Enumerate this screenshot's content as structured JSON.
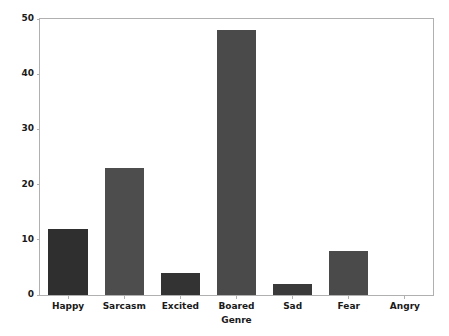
{
  "chart_data": {
    "type": "bar",
    "title": "",
    "xlabel": "Genre",
    "ylabel": "",
    "categories": [
      "Happy",
      "Sarcasm",
      "Excited",
      "Boared",
      "Sad",
      "Fear",
      "Angry"
    ],
    "values": [
      12,
      23,
      4,
      48,
      2,
      8,
      0
    ],
    "bar_colors": [
      "#2f2f2f",
      "#4d4d4d",
      "#333333",
      "#4a4a4a",
      "#3a3a3a",
      "#4a4a4a",
      "#4a4a4a"
    ],
    "ylim": [
      0,
      50
    ],
    "yticks": [
      0,
      10,
      20,
      30,
      40,
      50
    ],
    "ytick_labels": [
      "0",
      "10",
      "20",
      "30",
      "40",
      "50"
    ],
    "grid": false,
    "legend": null,
    "axes_color": "#b0b0b0",
    "background": "#ffffff"
  }
}
